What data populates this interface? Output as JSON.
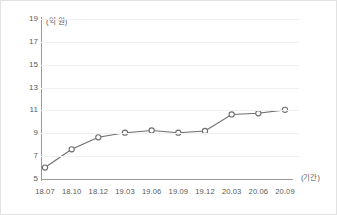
{
  "chart_data": {
    "type": "line",
    "title": "",
    "subtitle": "",
    "xlabel": "(기간)",
    "ylabel": "(억 원)",
    "categories": [
      "18.07",
      "18.10",
      "18.12",
      "19.03",
      "19.06",
      "19.09",
      "19.12",
      "20.03",
      "20.06",
      "20.09"
    ],
    "values": [
      6.0,
      7.6,
      8.65,
      9.05,
      9.25,
      9.05,
      9.2,
      10.65,
      10.75,
      11.05
    ],
    "series": [
      {
        "name": "",
        "values": [
          6.0,
          7.6,
          8.65,
          9.05,
          9.25,
          9.05,
          9.2,
          10.65,
          10.75,
          11.05
        ]
      }
    ],
    "ylim": [
      5,
      19
    ],
    "yticks": [
      5,
      7,
      9,
      11,
      13,
      15,
      17,
      19
    ],
    "ytick_labels": [
      "5",
      "7",
      "9",
      "11",
      "13",
      "15",
      "17",
      "19"
    ],
    "grid": true,
    "grid_axis": "y",
    "legend": false,
    "legend_position": "none",
    "marker": "open-circle",
    "line_color": "#6e6e6e",
    "marker_fill": "#ffffff",
    "grid_color": "#f0f0f0",
    "axis_color": "#9a9a9a",
    "text_color": "#5a5a5a",
    "background": "#ffffff",
    "border_color": "#e2e2e2"
  }
}
